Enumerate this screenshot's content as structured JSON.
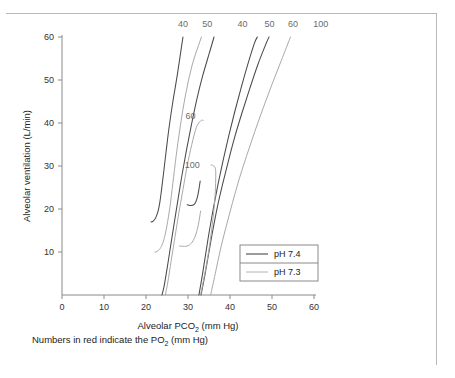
{
  "figure": {
    "footnote_prefix": "Numbers in red indicate the PO",
    "footnote_sub": "2",
    "footnote_suffix": " (mm Hg)"
  },
  "chart_data": {
    "type": "line",
    "title": "",
    "xlabel_prefix": "Alveolar PCO",
    "xlabel_sub": "2",
    "xlabel_suffix": " (mm Hg)",
    "ylabel": "Alveolar ventilation (L/min)",
    "xlim": [
      0,
      60
    ],
    "ylim": [
      0,
      62
    ],
    "xticks": [
      0,
      10,
      20,
      30,
      40,
      50,
      60
    ],
    "xticklabels": [
      "0",
      "10",
      "20",
      "30",
      "40",
      "50",
      "60"
    ],
    "yticks": [
      10,
      20,
      30,
      40,
      50,
      60
    ],
    "yticklabels": [
      "10",
      "20",
      "30",
      "40",
      "50",
      "60"
    ],
    "grid": false,
    "legend_position": "lower-right",
    "legend": [
      {
        "label": "pH 7.4",
        "color": "#4a4a4a"
      },
      {
        "label": "pH 7.3",
        "color": "#a9a9a9"
      }
    ],
    "annotations_note": "Numbers along top and inside plot are PO2 isopleth values in mm Hg",
    "series": [
      {
        "name": "pH 7.4, PO2 40",
        "ph": "7.4",
        "po2": 40,
        "color": "#4a4a4a",
        "top_label": "40",
        "top_label_x": 28.8,
        "label_x": 28.8,
        "label_y": 63.5,
        "points": [
          [
            21.2,
            17.0
          ],
          [
            21.6,
            17.1
          ],
          [
            22.1,
            17.6
          ],
          [
            22.5,
            18.4
          ],
          [
            22.9,
            19.6
          ],
          [
            23.3,
            21.6
          ],
          [
            23.7,
            24.5
          ],
          [
            24.2,
            28.5
          ],
          [
            24.8,
            33.5
          ],
          [
            25.5,
            39.0
          ],
          [
            26.4,
            45.0
          ],
          [
            27.5,
            51.5
          ],
          [
            28.8,
            60.0
          ]
        ]
      },
      {
        "name": "pH 7.3, PO2 40",
        "ph": "7.3",
        "po2": 40,
        "color": "#a9a9a9",
        "top_label": "50",
        "top_label_x": 34.8,
        "label_x": 34.8,
        "label_y": 63.5,
        "points": [
          [
            22.1,
            10.0
          ],
          [
            22.6,
            10.1
          ],
          [
            23.2,
            10.6
          ],
          [
            23.8,
            11.6
          ],
          [
            24.4,
            13.4
          ],
          [
            25.0,
            16.2
          ],
          [
            25.7,
            20.5
          ],
          [
            26.4,
            26.0
          ],
          [
            27.2,
            32.5
          ],
          [
            28.2,
            39.5
          ],
          [
            29.4,
            46.5
          ],
          [
            31.0,
            53.5
          ],
          [
            33.2,
            60.0
          ]
        ]
      },
      {
        "name": "pH 7.4, PO2 50",
        "ph": "7.4",
        "po2": 50,
        "color": "#4a4a4a",
        "top_label": "40",
        "top_label_x": 43.1,
        "label_x": 43.1,
        "label_y": 63.5,
        "points": [
          [
            23.8,
            0.0
          ],
          [
            24.3,
            2.0
          ],
          [
            25.0,
            6.0
          ],
          [
            25.8,
            11.0
          ],
          [
            26.6,
            16.0
          ],
          [
            27.5,
            21.5
          ],
          [
            28.5,
            27.5
          ],
          [
            29.6,
            33.5
          ],
          [
            30.8,
            39.5
          ],
          [
            32.1,
            45.5
          ],
          [
            33.5,
            51.0
          ],
          [
            35.0,
            56.0
          ],
          [
            36.2,
            60.0
          ]
        ]
      },
      {
        "name": "pH 7.3, PO2 60",
        "ph": "7.3",
        "po2": 60,
        "color": "#a9a9a9",
        "top_label": "",
        "inner_label": "60",
        "inner_label_x": 30.5,
        "inner_label_y": 41.5,
        "points": [
          [
            24.6,
            0.0
          ],
          [
            25.2,
            3.0
          ],
          [
            26.0,
            8.0
          ],
          [
            26.9,
            13.5
          ],
          [
            27.8,
            19.0
          ],
          [
            28.8,
            24.5
          ],
          [
            29.8,
            30.0
          ],
          [
            30.9,
            35.0
          ],
          [
            32.0,
            39.0
          ],
          [
            33.0,
            40.5
          ],
          [
            33.6,
            40.6
          ]
        ]
      },
      {
        "name": "pH 7.4, PO2 60",
        "ph": "7.4",
        "po2": 60,
        "color": "#4a4a4a",
        "top_label": "50",
        "top_label_x": 49.5,
        "label_x": 49.5,
        "label_y": 63.5,
        "points": [
          [
            32.6,
            0.0
          ],
          [
            33.4,
            4.5
          ],
          [
            34.2,
            9.5
          ],
          [
            35.1,
            15.0
          ],
          [
            36.1,
            20.5
          ],
          [
            37.2,
            26.0
          ],
          [
            38.4,
            31.5
          ],
          [
            39.7,
            37.0
          ],
          [
            41.1,
            42.5
          ],
          [
            42.6,
            48.0
          ],
          [
            44.2,
            53.5
          ],
          [
            45.8,
            58.5
          ],
          [
            46.5,
            60.0
          ]
        ]
      },
      {
        "name": "pH 7.4, PO2 100",
        "ph": "7.4",
        "po2": 100,
        "color": "#4a4a4a",
        "top_label": "60",
        "top_label_x": 55.2,
        "label_x": 55.2,
        "label_y": 63.5,
        "points": [
          [
            33.1,
            0.0
          ],
          [
            34.0,
            4.5
          ],
          [
            34.9,
            9.5
          ],
          [
            35.9,
            15.0
          ],
          [
            37.0,
            20.5
          ],
          [
            38.3,
            26.0
          ],
          [
            39.7,
            31.5
          ],
          [
            41.2,
            37.0
          ],
          [
            42.9,
            42.5
          ],
          [
            44.7,
            48.0
          ],
          [
            46.6,
            53.5
          ],
          [
            48.6,
            58.5
          ],
          [
            49.3,
            60.0
          ]
        ]
      },
      {
        "name": "pH 7.3, PO2 100",
        "ph": "7.3",
        "po2": 100,
        "color": "#a9a9a9",
        "top_label": "100",
        "top_label_x": 61.5,
        "inner_label": "100",
        "inner_label_x": 30.9,
        "inner_label_y": 29.8,
        "points": [
          [
            33.0,
            0.0
          ],
          [
            34.0,
            5.0
          ],
          [
            34.9,
            10.0
          ],
          [
            35.6,
            15.0
          ],
          [
            36.2,
            20.0
          ],
          [
            36.5,
            24.0
          ],
          [
            36.6,
            27.5
          ],
          [
            36.5,
            29.5
          ],
          [
            35.8,
            30.2
          ],
          [
            35.5,
            30.2
          ]
        ]
      },
      {
        "name": "pH 7.3, PO2 50 upper",
        "ph": "7.3",
        "po2": 50,
        "color": "#a9a9a9",
        "top_label": "100",
        "top_label_x": 55.8,
        "points": [
          [
            35.4,
            0.0
          ],
          [
            36.5,
            5.0
          ],
          [
            37.7,
            10.5
          ],
          [
            39.1,
            16.0
          ],
          [
            40.6,
            21.5
          ],
          [
            42.2,
            27.0
          ],
          [
            44.0,
            32.5
          ],
          [
            45.9,
            38.0
          ],
          [
            47.9,
            43.5
          ],
          [
            50.0,
            49.0
          ],
          [
            52.2,
            54.5
          ],
          [
            54.4,
            60.0
          ]
        ]
      },
      {
        "name": "pH 7.4 hook 21",
        "ph": "7.4",
        "po2": 0,
        "color": "#4a4a4a",
        "top_label": "",
        "points": [
          [
            29.8,
            21.0
          ],
          [
            30.8,
            20.8
          ],
          [
            31.6,
            21.2
          ],
          [
            32.1,
            22.3
          ],
          [
            32.5,
            24.0
          ],
          [
            32.9,
            26.5
          ]
        ]
      },
      {
        "name": "pH 7.3 hook 11.5",
        "ph": "7.3",
        "po2": 0,
        "color": "#a9a9a9",
        "top_label": "",
        "points": [
          [
            28.0,
            11.4
          ],
          [
            29.2,
            11.3
          ],
          [
            30.3,
            11.6
          ],
          [
            31.2,
            12.6
          ],
          [
            31.9,
            14.2
          ],
          [
            32.5,
            16.5
          ],
          [
            33.0,
            19.5
          ]
        ]
      }
    ],
    "top_labels": [
      {
        "text": "40",
        "x": 28.8
      },
      {
        "text": "50",
        "x": 34.6
      },
      {
        "text": "40",
        "x": 43.0
      },
      {
        "text": "50",
        "x": 49.4
      },
      {
        "text": "60",
        "x": 55.0
      },
      {
        "text": "100",
        "x": 61.6
      }
    ],
    "inner_labels": [
      {
        "text": "60",
        "x": 30.6,
        "y": 41.0
      },
      {
        "text": "100",
        "x": 31.0,
        "y": 29.6
      }
    ]
  }
}
